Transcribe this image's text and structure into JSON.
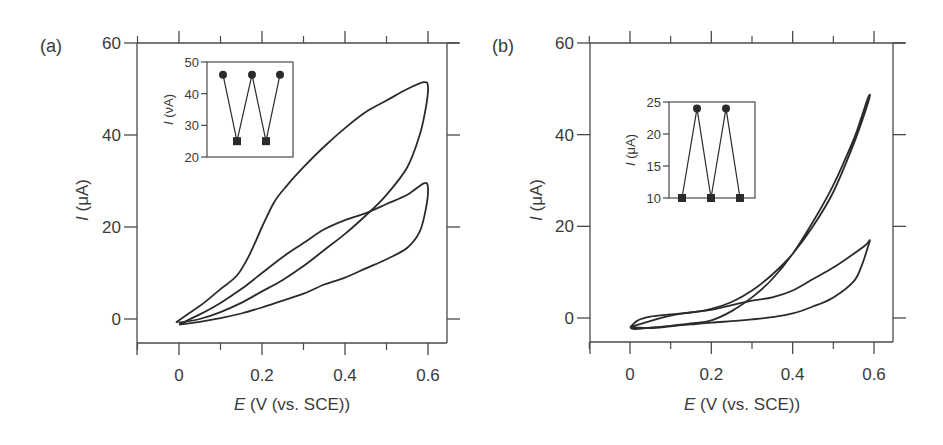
{
  "chart_data": [
    {
      "panel": "(a)",
      "type": "line",
      "subtype": "cyclic-voltammogram",
      "xlabel": "E (V (vs. SCE))",
      "xlabel_italic": "E",
      "xlabel_rest": " (V (vs. SCE))",
      "ylabel": "I (μA)",
      "ylabel_italic": "I",
      "ylabel_rest": " (μA)",
      "xlim": [
        -0.1,
        0.65
      ],
      "ylim": [
        -5,
        60
      ],
      "xticks": [
        0,
        0.2,
        0.4,
        0.6
      ],
      "xtick_labels": [
        "0",
        "0.2",
        "0.4",
        "0.6"
      ],
      "xminor": [
        -0.1,
        0.1,
        0.3,
        0.5
      ],
      "yticks": [
        0,
        20,
        40,
        60
      ],
      "ytick_labels": [
        "0",
        "20",
        "40",
        "60"
      ],
      "grid": false,
      "series": [
        {
          "name": "cycle-1 (high current loop)",
          "x": [
            0.0,
            -0.005,
            0.02,
            0.06,
            0.1,
            0.14,
            0.17,
            0.2,
            0.23,
            0.26,
            0.3,
            0.35,
            0.4,
            0.45,
            0.5,
            0.55,
            0.59,
            0.6,
            0.595,
            0.58,
            0.55,
            0.5,
            0.45,
            0.4,
            0.35,
            0.3,
            0.25,
            0.2,
            0.15,
            0.1,
            0.05,
            0.0
          ],
          "y": [
            -0.5,
            -0.6,
            1.0,
            3.5,
            6.5,
            9.5,
            14,
            20,
            25.5,
            29,
            33,
            37.5,
            41.5,
            45,
            47.5,
            50,
            51.5,
            50.5,
            46,
            40,
            33,
            27,
            22.5,
            18.5,
            15,
            11.5,
            8.5,
            6,
            3.5,
            1.5,
            0,
            -0.8
          ]
        },
        {
          "name": "cycle-2 (low current loop)",
          "x": [
            0.0,
            0.05,
            0.1,
            0.15,
            0.2,
            0.25,
            0.3,
            0.35,
            0.4,
            0.45,
            0.5,
            0.55,
            0.59,
            0.6,
            0.595,
            0.58,
            0.55,
            0.5,
            0.45,
            0.4,
            0.35,
            0.3,
            0.25,
            0.2,
            0.15,
            0.1,
            0.05,
            0.0
          ],
          "y": [
            -1.2,
            1.0,
            3.5,
            6.5,
            10,
            13.5,
            16.5,
            19.5,
            21.5,
            23,
            25,
            27,
            29.5,
            28.5,
            24,
            19,
            15.5,
            13,
            11,
            9,
            7.5,
            5.5,
            4,
            2.5,
            1.2,
            0.2,
            -0.6,
            -1.2
          ]
        }
      ],
      "inset": {
        "ylabel": "I (νA)",
        "ylabel_italic": "I",
        "ylabel_rest": " (νA)",
        "ylim": [
          20,
          50
        ],
        "yticks": [
          20,
          30,
          40,
          50
        ],
        "ytick_labels": [
          "20",
          "30",
          "40",
          "50"
        ],
        "points": [
          {
            "index": 1,
            "value": 46,
            "marker": "circle"
          },
          {
            "index": 2,
            "value": 25,
            "marker": "square"
          },
          {
            "index": 3,
            "value": 46,
            "marker": "circle"
          },
          {
            "index": 4,
            "value": 25,
            "marker": "square"
          },
          {
            "index": 5,
            "value": 46,
            "marker": "circle"
          }
        ]
      }
    },
    {
      "panel": "(b)",
      "type": "line",
      "subtype": "cyclic-voltammogram",
      "xlabel": "E (V (vs. SCE))",
      "xlabel_italic": "E",
      "xlabel_rest": " (V (vs. SCE))",
      "ylabel": "I (μA)",
      "ylabel_italic": "I",
      "ylabel_rest": " (μA)",
      "xlim": [
        -0.1,
        0.65
      ],
      "ylim": [
        -5,
        60
      ],
      "xticks": [
        0,
        0.2,
        0.4,
        0.6
      ],
      "xtick_labels": [
        "0",
        "0.2",
        "0.4",
        "0.6"
      ],
      "xminor": [
        -0.1,
        0.1,
        0.3,
        0.5
      ],
      "yticks": [
        0,
        20,
        40,
        60
      ],
      "ytick_labels": [
        "0",
        "20",
        "40",
        "60"
      ],
      "grid": false,
      "series": [
        {
          "name": "cycle-1 (high current loop)",
          "x": [
            0.0,
            0.02,
            0.05,
            0.1,
            0.15,
            0.2,
            0.25,
            0.3,
            0.35,
            0.4,
            0.45,
            0.5,
            0.55,
            0.58,
            0.59,
            0.585,
            0.57,
            0.55,
            0.5,
            0.45,
            0.4,
            0.35,
            0.3,
            0.25,
            0.2,
            0.15,
            0.1,
            0.05,
            0.01,
            0.0
          ],
          "y": [
            -2.0,
            -0.5,
            0.3,
            0.8,
            1.2,
            2.0,
            3.5,
            6,
            9.5,
            14,
            20,
            27.5,
            38,
            45.5,
            48.5,
            48,
            44,
            39,
            29,
            21,
            14,
            8.5,
            4.5,
            1.5,
            -0.5,
            -1.2,
            -1.7,
            -2.1,
            -2.4,
            -2.0
          ]
        },
        {
          "name": "cycle-2 (low current loop)",
          "x": [
            0.0,
            0.1,
            0.2,
            0.25,
            0.3,
            0.35,
            0.4,
            0.45,
            0.5,
            0.55,
            0.58,
            0.59,
            0.585,
            0.57,
            0.55,
            0.5,
            0.45,
            0.4,
            0.35,
            0.3,
            0.25,
            0.2,
            0.15,
            0.1,
            0.05,
            0.0
          ],
          "y": [
            -2.0,
            0.5,
            1.8,
            2.8,
            3.8,
            4.5,
            6,
            8.5,
            11,
            14,
            16,
            17,
            15.5,
            11.5,
            8,
            4.5,
            2.5,
            1.0,
            0.2,
            -0.3,
            -0.7,
            -1.0,
            -1.4,
            -1.8,
            -2.2,
            -2.0
          ]
        }
      ],
      "inset": {
        "ylabel": "I (μA)",
        "ylabel_italic": "I",
        "ylabel_rest": " (μA)",
        "ylim": [
          10,
          25
        ],
        "yticks": [
          10,
          15,
          20,
          25
        ],
        "ytick_labels": [
          "10",
          "15",
          "20",
          "25"
        ],
        "points": [
          {
            "index": 1,
            "value": 10,
            "marker": "square"
          },
          {
            "index": 2,
            "value": 24,
            "marker": "circle"
          },
          {
            "index": 3,
            "value": 10,
            "marker": "square"
          },
          {
            "index": 4,
            "value": 24,
            "marker": "circle"
          },
          {
            "index": 5,
            "value": 10,
            "marker": "square"
          }
        ]
      }
    }
  ],
  "layout": {
    "colors": {
      "axis": "#4a4a4a",
      "curve": "#2b2b2b",
      "marker": "#2b2b2b",
      "text": "#3a3a3a"
    },
    "panels": [
      {
        "frame": {
          "left": 137,
          "top": 43,
          "right": 447,
          "bottom": 343
        },
        "x_map": {
          "v0": 0.0,
          "px0": 179,
          "v1": 0.6,
          "px1": 428
        },
        "y_map": {
          "v0": 0,
          "px0": 319,
          "v1": 60,
          "px1": 43
        },
        "top_axis_y": 43,
        "bottom_axis_y": 343,
        "left_axis_x": 137,
        "right_axis_x": 447,
        "outer_left_axis_x": 137,
        "outer_top_axis_y": 43,
        "label_pos": {
          "x": 40,
          "y": 52
        },
        "xlabel_pos": {
          "x": 292,
          "y": 410
        },
        "ylabel_pos": {
          "x": 88,
          "y": 200
        },
        "inset_frame": {
          "left": 207,
          "top": 62,
          "right": 293,
          "bottom": 157
        },
        "inset_x": [
          223,
          237,
          252,
          266,
          280
        ]
      },
      {
        "frame": {
          "left": 590,
          "top": 43,
          "right": 893,
          "bottom": 342
        },
        "x_map": {
          "v0": 0.0,
          "px0": 630,
          "v1": 0.6,
          "px1": 874
        },
        "y_map": {
          "v0": 0,
          "px0": 318,
          "v1": 60,
          "px1": 43
        },
        "top_axis_y": 43,
        "bottom_axis_y": 342,
        "left_axis_x": 590,
        "right_axis_x": 893,
        "outer_left_axis_x": 590,
        "outer_top_axis_y": 43,
        "label_pos": {
          "x": 492,
          "y": 52
        },
        "xlabel_pos": {
          "x": 742,
          "y": 410
        },
        "ylabel_pos": {
          "x": 542,
          "y": 200
        },
        "inset_frame": {
          "left": 669,
          "top": 102,
          "right": 755,
          "bottom": 198
        },
        "inset_x": [
          682,
          697,
          711,
          726,
          740
        ]
      }
    ]
  }
}
